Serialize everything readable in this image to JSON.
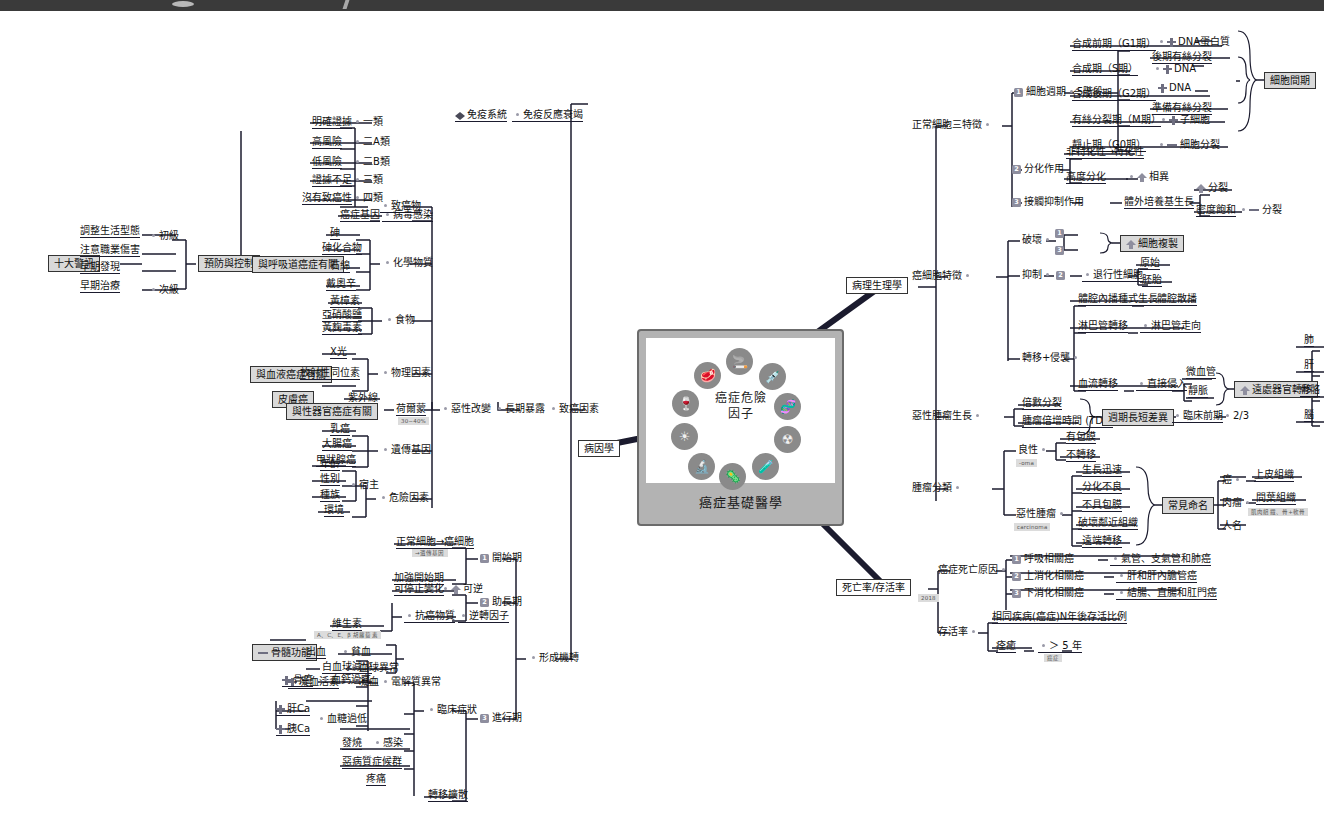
{
  "document": {
    "type": "mind-map",
    "center": {
      "title_line1": "癌症危險",
      "title_line2": "因子",
      "caption": "癌症基礎醫學",
      "risk_icons": [
        {
          "name": "meat-icon",
          "glyph": "🥩"
        },
        {
          "name": "cigarette-icon",
          "glyph": "🚬"
        },
        {
          "name": "syringe-icon",
          "glyph": "💉"
        },
        {
          "name": "dna-icon",
          "glyph": "🧬"
        },
        {
          "name": "radiation-icon",
          "glyph": "☢"
        },
        {
          "name": "chemical-icon",
          "glyph": "🧪"
        },
        {
          "name": "germ-icon",
          "glyph": "🦠"
        },
        {
          "name": "virus-icon",
          "glyph": "🔬"
        },
        {
          "name": "sunlight-icon",
          "glyph": "☀"
        },
        {
          "name": "wine-icon",
          "glyph": "🍷"
        }
      ]
    }
  },
  "main_branches": {
    "etiology": "病因學",
    "pathophysiology": "病理生理學",
    "mortality_survival": "死亡率/存活率"
  },
  "prevention": {
    "root": "預防與控制",
    "primary": "初級",
    "secondary": "次級",
    "primary_items": [
      "調整生活型態",
      "注意職業傷害"
    ],
    "secondary_items": [
      "早期發現",
      "早期治療"
    ],
    "ten_warnings": "十大警訊"
  },
  "carcinogens": {
    "label": "致癌物",
    "rows": [
      {
        "desc": "明確證據",
        "group": "一類"
      },
      {
        "desc": "高風險",
        "group": "二A類"
      },
      {
        "desc": "低風險",
        "group": "二B類"
      },
      {
        "desc": "證據不足",
        "group": "三類"
      },
      {
        "desc": "沒有致癌性",
        "group": "四類"
      }
    ]
  },
  "carcinogenic_factors": {
    "label": "致癌因素",
    "long_exposure": "長期暴露",
    "malignant_change": "惡性改變",
    "virus": {
      "gene": "癌症基因",
      "infection": "病毒感染"
    },
    "chemical": {
      "label": "化學物質",
      "group_note": "與呼吸道癌症有關",
      "items": [
        "砷",
        "砷化合物",
        "石綿",
        "戴奧辛"
      ]
    },
    "food": {
      "label": "食物",
      "items": [
        "黃樟素",
        "亞硝酸鹽",
        "黃麴毒素"
      ]
    },
    "physical": {
      "label": "物理因素",
      "blood_note": "與血液癌症有關",
      "skin_note": "皮膚癌",
      "items": [
        "X光",
        "放射性同位素",
        "紫外線"
      ]
    },
    "hormone": {
      "label": "荷爾蒙",
      "note": "與性器官癌症有關",
      "percent": "30~40%"
    },
    "genetic": {
      "label": "遺傳基因",
      "items": [
        "乳癌",
        "大腸癌",
        "甲狀腺癌"
      ]
    },
    "risk_factor": {
      "label": "危險因素",
      "host": "宿主",
      "host_items": [
        "年齡",
        "性別",
        "種族"
      ],
      "environment": "環境"
    }
  },
  "immune": {
    "system": "免疫系統",
    "decline": "免疫反應衰竭"
  },
  "formation": {
    "label": "形成機轉",
    "stages": [
      {
        "n": "1",
        "name": "開始期",
        "items": [
          "正常細胞→癌細胞",
          "加強開始期"
        ],
        "note": "→遺傳基因"
      },
      {
        "n": "2",
        "name": "助長期",
        "items": [
          "可停止變化",
          "抗癌物質"
        ],
        "reverse": "可逆",
        "factor": "逆轉因子",
        "vitamin": "維生素",
        "vitamin_note": "A、C、E、β 胡蘿蔔素"
      },
      {
        "n": "3",
        "name": "進行期",
        "items": [
          "臨床症狀",
          "轉移擴散"
        ]
      }
    ]
  },
  "clinical": {
    "label": "臨床症狀",
    "marrow": "骨髓功能",
    "blood_abnormal": "血球異常",
    "bleeding": "出血",
    "anemia": "貧血",
    "leukopenia": "白血球減少",
    "clotting_factor": "凝血活素",
    "clotting": "凝血",
    "electrolyte": "電解質異常",
    "bone_cancer": "骨癌",
    "hypercalcemia": "血鈣過高",
    "liver_ca": "肝Ca",
    "pancreas_ca": "胰Ca",
    "hypoglycemia": "血糖過低",
    "fever": "發燒",
    "infection": "感染",
    "cachexia": "惡病質症候群",
    "pain": "疼痛",
    "metastasis_spread": "轉移擴散"
  },
  "normal_cell": {
    "label": "正常細胞三特徵",
    "cell_cycle": {
      "n": "1",
      "label": "細胞週期",
      "stages": "5階段",
      "bracket": "細胞間期",
      "phases": [
        {
          "name": "合成前期（G1期）",
          "a": "DNA蛋白質",
          "b": "後期有絲分裂"
        },
        {
          "name": "合成期（S期）",
          "a": "DNA"
        },
        {
          "name": "合成後期（G2期）",
          "a": "DNA",
          "b": "準備有絲分裂"
        },
        {
          "name": "有絲分裂期（M期）",
          "a": "子細胞"
        },
        {
          "name": "靜止期（G0期）",
          "a": "細胞分裂"
        }
      ]
    },
    "differentiation": {
      "n": "2",
      "label": "分化作用",
      "arrow": "非特化性→特化性",
      "high": "高度分化",
      "diff": "相異"
    },
    "contact_inhibition": {
      "n": "3",
      "label": "接觸抑制作用",
      "growth": "體外培養基生長",
      "divide": "分裂",
      "saturate": "密度飽和",
      "stop": "分裂"
    }
  },
  "cancer_cell": {
    "label": "癌細胞特徵",
    "destroy": {
      "label": "破壞",
      "n1": "1",
      "n2": "3",
      "result": "細胞複製"
    },
    "inhibit": {
      "label": "抑制",
      "n": "2",
      "target": "退行性細胞",
      "primitive": "原始",
      "embryo": "胚胎"
    },
    "metastasis": {
      "label": "轉移+侵襲",
      "cavity": "體腔內播種式生長",
      "cavity_spread": "體腔散播",
      "lymph": "淋巴管轉移",
      "lymph_dir": "淋巴管走向",
      "blood": "血流轉移",
      "invade": "直接侵入",
      "capillary": "微血管",
      "vein": "靜脈",
      "distant": "遠處器官轉移",
      "organs": [
        "肺",
        "肝",
        "骨骼",
        "腦"
      ]
    }
  },
  "malignant_growth": {
    "label": "惡性腫瘤生長",
    "doubling": "倍數分裂",
    "tdt": "腫瘤倍增時間 (TDT)",
    "cycle_diff": "週期長短差異",
    "preclinical": "臨床前期",
    "fraction": "2/3"
  },
  "tumor_class": {
    "label": "腫瘤分類",
    "benign": {
      "label": "良性",
      "suffix": "-oma",
      "items": [
        "有包膜",
        "不轉移"
      ]
    },
    "malignant": {
      "label": "惡性腫瘤",
      "suffix": "carcinoma",
      "items": [
        "生長迅速",
        "分化不良",
        "不具包膜",
        "破壞鄰近組織",
        "遠端轉移"
      ]
    },
    "naming": {
      "label": "常見命名",
      "rows": [
        {
          "name": "癌",
          "tissue": "上皮組織"
        },
        {
          "name": "肉瘤",
          "tissue": "間葉組織",
          "note": "肌肉組織、骨+軟骨"
        },
        {
          "name": "人名",
          "tissue": ""
        }
      ]
    }
  },
  "mortality": {
    "label": "死亡率/存活率",
    "death_cause": "癌症死亡原因",
    "year": "2018",
    "causes": [
      {
        "n": "1",
        "name": "呼吸相關癌",
        "detail": "氣管、支氣管和肺癌"
      },
      {
        "n": "2",
        "name": "上消化相關癌",
        "detail": "肝和肝內膽管癌"
      },
      {
        "n": "3",
        "name": "下消化相關癌",
        "detail": "結腸、直腸和肛門癌"
      }
    ],
    "survival": {
      "label": "存活率",
      "definition": "相同疾病(癌症)N年後存活比例",
      "cure": "痊癒",
      "years": "＞ 5 年",
      "note": "癌症"
    }
  },
  "colors": {
    "line": "#1b1b2e",
    "node_fill": "#d9d9d9",
    "badge": "#8e8e9e",
    "top_bar": "#3a3a3a"
  }
}
